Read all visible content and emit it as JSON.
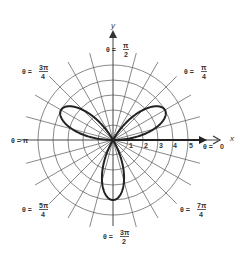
{
  "diagram": {
    "background": "#ffffff",
    "grid_color": "#555555",
    "curve_color": "#222222",
    "center": {
      "x": 113,
      "y": 140
    },
    "unit_px": 15,
    "circle_radii": [
      1,
      2,
      3,
      4,
      5
    ],
    "spoke_step_deg": 15,
    "spoke_length_units": 6,
    "axes": {
      "x_label": "x",
      "y_label": "y"
    },
    "radial_ticks": [
      "1",
      "2",
      "3",
      "4",
      "5"
    ],
    "angle_labels": [
      {
        "id": "theta-0",
        "prefix": "θ = ",
        "num": "0",
        "den": "",
        "x": 203,
        "y": 149
      },
      {
        "id": "theta-pi-over-4",
        "prefix": "θ = ",
        "num": "π",
        "den": "4",
        "x": 184,
        "y": 74
      },
      {
        "id": "theta-pi-over-2",
        "prefix": "θ = ",
        "num": "π",
        "den": "2",
        "x": 106,
        "y": 52
      },
      {
        "id": "theta-3pi-over-4",
        "prefix": "θ = ",
        "num": "3π",
        "den": "4",
        "x": 22,
        "y": 74
      },
      {
        "id": "theta-pi",
        "prefix": "θ = π",
        "num": "",
        "den": "",
        "x": 11,
        "y": 143
      },
      {
        "id": "theta-5pi-over-4",
        "prefix": "θ = ",
        "num": "5π",
        "den": "4",
        "x": 22,
        "y": 212
      },
      {
        "id": "theta-3pi-over-2",
        "prefix": "θ = ",
        "num": "3π",
        "den": "2",
        "x": 103,
        "y": 239
      },
      {
        "id": "theta-7pi-over-4",
        "prefix": "θ = ",
        "num": "7π",
        "den": "4",
        "x": 180,
        "y": 212
      }
    ]
  },
  "chart_data": {
    "type": "line",
    "equation": "r = 4 sin 3θ",
    "coordinate_system": "polar",
    "petals": 3,
    "max_r": 4,
    "petal_tip_angles_deg": [
      30,
      150,
      270
    ],
    "radial_ticks": [
      1,
      2,
      3,
      4,
      5
    ],
    "angle_labels": [
      "θ = 0",
      "θ = π/4",
      "θ = π/2",
      "θ = 3π/4",
      "θ = π",
      "θ = 5π/4",
      "θ = 3π/2",
      "θ = 7π/4"
    ],
    "xlabel": "x",
    "ylabel": "y",
    "rlim": [
      0,
      5
    ],
    "grid": true
  }
}
